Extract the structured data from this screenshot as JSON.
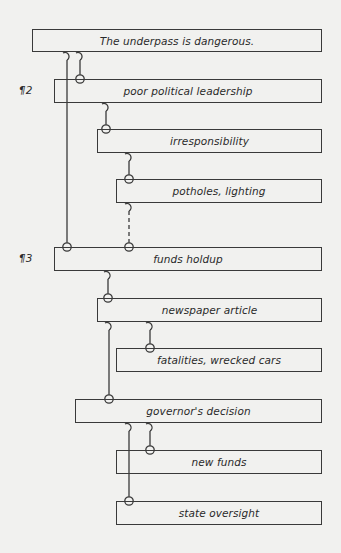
{
  "diagram": {
    "title": "The underpass is dangerous.",
    "paragraph_marks": [
      {
        "label": "¶2",
        "x": 19,
        "y": 84
      },
      {
        "label": "¶3",
        "x": 19,
        "y": 252
      }
    ],
    "nodes": [
      {
        "id": "n1",
        "label": "The underpass is dangerous.",
        "x": 32,
        "y": 29,
        "w": 290,
        "h": 23
      },
      {
        "id": "n2",
        "label": "poor political leadership",
        "x": 54,
        "y": 79,
        "w": 268,
        "h": 24
      },
      {
        "id": "n3",
        "label": "irresponsibility",
        "x": 97,
        "y": 129,
        "w": 225,
        "h": 24
      },
      {
        "id": "n4",
        "label": "potholes, lighting",
        "x": 116,
        "y": 179,
        "w": 206,
        "h": 24
      },
      {
        "id": "n5",
        "label": "funds holdup",
        "x": 54,
        "y": 247,
        "w": 268,
        "h": 24
      },
      {
        "id": "n6",
        "label": "newspaper article",
        "x": 97,
        "y": 298,
        "w": 225,
        "h": 24
      },
      {
        "id": "n7",
        "label": "fatalities, wrecked cars",
        "x": 116,
        "y": 348,
        "w": 206,
        "h": 24
      },
      {
        "id": "n8",
        "label": "governor's decision",
        "x": 75,
        "y": 399,
        "w": 247,
        "h": 24
      },
      {
        "id": "n9",
        "label": "new funds",
        "x": 116,
        "y": 450,
        "w": 206,
        "h": 24
      },
      {
        "id": "n10",
        "label": "state oversight",
        "x": 116,
        "y": 501,
        "w": 206,
        "h": 24
      }
    ],
    "links": [
      {
        "from": "n1",
        "to": "n5",
        "x": 67,
        "y1": 52,
        "y2": 247,
        "style": "solid"
      },
      {
        "from": "n1",
        "to": "n2",
        "x": 80,
        "y1": 52,
        "y2": 79,
        "style": "solid"
      },
      {
        "from": "n2",
        "to": "n3",
        "x": 106,
        "y1": 103,
        "y2": 129,
        "style": "solid"
      },
      {
        "from": "n3",
        "to": "n4",
        "x": 129,
        "y1": 153,
        "y2": 179,
        "style": "solid"
      },
      {
        "from": "n4",
        "to": "n5",
        "x": 129,
        "y1": 203,
        "y2": 247,
        "style": "dashed"
      },
      {
        "from": "n5",
        "to": "n6",
        "x": 108,
        "y1": 271,
        "y2": 298,
        "style": "solid"
      },
      {
        "from": "n6",
        "to": "n8",
        "x": 109,
        "y1": 322,
        "y2": 399,
        "style": "solid"
      },
      {
        "from": "n6",
        "to": "n7",
        "x": 150,
        "y1": 322,
        "y2": 348,
        "style": "solid"
      },
      {
        "from": "n8",
        "to": "n10",
        "x": 129,
        "y1": 423,
        "y2": 501,
        "style": "solid"
      },
      {
        "from": "n8",
        "to": "n9",
        "x": 150,
        "y1": 423,
        "y2": 450,
        "style": "solid"
      }
    ],
    "colors": {
      "background": "#f1f1ef",
      "line": "#3a3a3a",
      "text": "#2a2a2a"
    }
  }
}
